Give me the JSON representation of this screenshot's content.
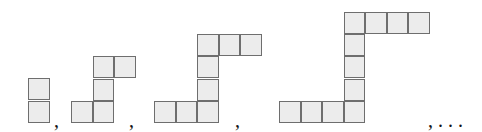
{
  "diagram": {
    "cell_size_px": 21.5,
    "colors": {
      "fill": "#ececec",
      "border": "#6e6e6e"
    },
    "figures": [
      {
        "index": 1,
        "cells": [
          [
            28,
            78
          ],
          [
            28,
            101
          ]
        ]
      },
      {
        "index": 2,
        "cells": [
          [
            71,
            101
          ],
          [
            92.5,
            101
          ],
          [
            92.5,
            78.5
          ],
          [
            92.5,
            56
          ],
          [
            114,
            56
          ]
        ]
      },
      {
        "index": 3,
        "cells": [
          [
            154,
            101
          ],
          [
            175.5,
            101
          ],
          [
            197,
            101
          ],
          [
            197,
            78.5
          ],
          [
            197,
            56
          ],
          [
            197,
            34
          ],
          [
            218.5,
            34
          ],
          [
            240,
            34
          ]
        ]
      },
      {
        "index": 4,
        "cells": [
          [
            279,
            101
          ],
          [
            300.5,
            101
          ],
          [
            322,
            101
          ],
          [
            343.5,
            101
          ],
          [
            343.5,
            78.5
          ],
          [
            343.5,
            56
          ],
          [
            343.5,
            34
          ],
          [
            343.5,
            12
          ],
          [
            365,
            12
          ],
          [
            386.5,
            12
          ],
          [
            408,
            12
          ]
        ]
      }
    ],
    "separators": [
      {
        "text": ",",
        "x": 54,
        "y": 110
      },
      {
        "text": ",",
        "x": 129,
        "y": 110
      },
      {
        "text": ",",
        "x": 235,
        "y": 110
      },
      {
        "text": ", . . .",
        "x": 428,
        "y": 110
      }
    ]
  }
}
